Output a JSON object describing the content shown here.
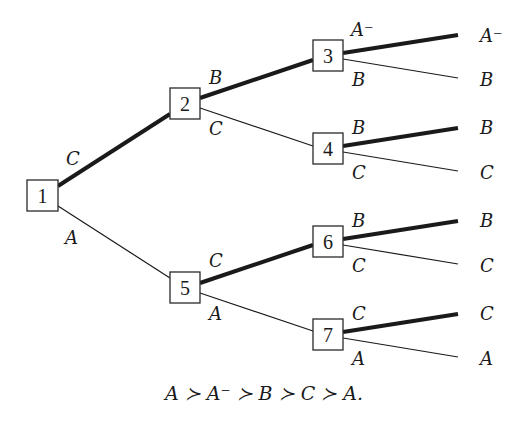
{
  "diagram": {
    "type": "game-tree",
    "nodes": [
      {
        "id": "1",
        "label": "1"
      },
      {
        "id": "2",
        "label": "2"
      },
      {
        "id": "3",
        "label": "3"
      },
      {
        "id": "4",
        "label": "4"
      },
      {
        "id": "5",
        "label": "5"
      },
      {
        "id": "6",
        "label": "6"
      },
      {
        "id": "7",
        "label": "7"
      }
    ],
    "edges": {
      "e1_2": {
        "label": "C",
        "bold": true
      },
      "e1_5": {
        "label": "A",
        "bold": false
      },
      "e2_3": {
        "label": "B",
        "bold": true
      },
      "e2_4": {
        "label": "C",
        "bold": false
      },
      "e5_6": {
        "label": "C",
        "bold": true
      },
      "e5_7": {
        "label": "A",
        "bold": false
      },
      "e3_a": {
        "label": "A⁻",
        "bold": true
      },
      "e3_b": {
        "label": "B",
        "bold": false
      },
      "e4_a": {
        "label": "B",
        "bold": true
      },
      "e4_b": {
        "label": "C",
        "bold": false
      },
      "e6_a": {
        "label": "B",
        "bold": true
      },
      "e6_b": {
        "label": "C",
        "bold": false
      },
      "e7_a": {
        "label": "C",
        "bold": true
      },
      "e7_b": {
        "label": "A",
        "bold": false
      }
    },
    "leaves": [
      "A⁻",
      "B",
      "B",
      "C",
      "B",
      "C",
      "C",
      "A"
    ],
    "caption": "A ≻ A⁻ ≻ B ≻ C ≻ A.",
    "colors": {
      "ink": "#1a1a1a",
      "background": "#ffffff"
    }
  }
}
